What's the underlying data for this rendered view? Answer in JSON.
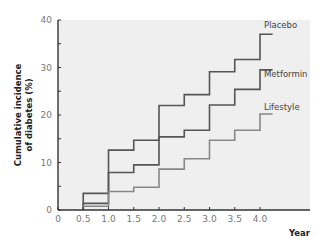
{
  "chart_data": {
    "type": "line",
    "step": true,
    "title": "",
    "xlabel": "Year",
    "ylabel": "Cumulative incidence of diabetes (%)",
    "ylabel_lines": [
      "Cumulative incidence",
      "of diabetes (%)"
    ],
    "xlim": [
      0,
      4.5
    ],
    "ylim": [
      0,
      40
    ],
    "x_ticks": [
      "0",
      "0.5",
      "1.0",
      "1.5",
      "2.0",
      "2.5",
      "3.0",
      "3.5",
      "4.0"
    ],
    "y_ticks": [
      "0",
      "10",
      "20",
      "30",
      "40"
    ],
    "grid": false,
    "legend_position": "inline-right",
    "x": [
      0.5,
      1.0,
      1.5,
      2.0,
      2.5,
      3.0,
      3.5,
      4.0,
      4.25
    ],
    "series": [
      {
        "name": "Placebo",
        "color": "#555555",
        "values": [
          3.5,
          12.6,
          14.7,
          22.0,
          24.3,
          29.1,
          31.7,
          37.0,
          37.0
        ]
      },
      {
        "name": "Metformin",
        "color": "#555555",
        "values": [
          1.4,
          7.9,
          9.5,
          15.4,
          16.8,
          22.1,
          25.4,
          29.5,
          29.5
        ]
      },
      {
        "name": "Lifestyle",
        "color": "#888888",
        "values": [
          0.8,
          3.9,
          4.8,
          8.6,
          10.8,
          14.7,
          16.8,
          20.2,
          20.2
        ]
      }
    ]
  }
}
